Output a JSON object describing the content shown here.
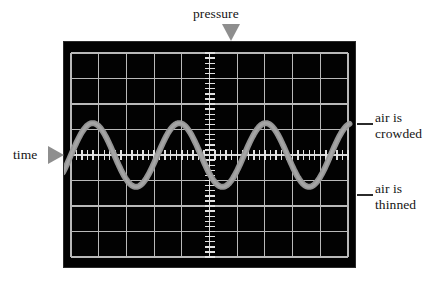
{
  "figure": {
    "background_color": "#ffffff"
  },
  "labels": {
    "pressure": "pressure",
    "time": "time",
    "crowded_line1": "air is",
    "crowded_line2": "crowded",
    "thinned_line1": "air is",
    "thinned_line2": "thinned",
    "crowded": "air is crowded",
    "thinned": "air is thinned"
  },
  "colors": {
    "screen_background": "#020202",
    "grid": "#b9b9b9",
    "axis": "#d8d8d8",
    "tick": "#e2e2e2",
    "trace": "#9a9a9a",
    "trace_core": "#ababab",
    "marker": "#8e8e8e",
    "text": "#151515",
    "leader": "#2b2b2b"
  },
  "scope": {
    "screen": {
      "x": 63,
      "y": 41,
      "width": 293,
      "height": 227
    },
    "grid": {
      "columns": 10,
      "rows": 8,
      "plot_x": 8,
      "plot_y": 12,
      "plot_width": 277,
      "plot_height": 204,
      "line_width": 1.1
    },
    "vertical_axis": {
      "name": "pressure-axis",
      "x_ratio": 0.5,
      "tick_count": 40,
      "tick_half_length": 5,
      "tick_width": 1.4
    },
    "horizontal_axis": {
      "name": "time-axis",
      "y_ratio": 0.5,
      "tick_count": 50,
      "tick_half_length": 5,
      "tick_width": 1.4
    }
  },
  "chart_data": {
    "type": "line",
    "xlabel": "time",
    "ylabel": "pressure",
    "grid": true,
    "legend": null,
    "annotations": [
      {
        "text": "pressure",
        "position": "top-center",
        "marker": "down-triangle"
      },
      {
        "text": "time",
        "position": "left-middle",
        "marker": "right-triangle"
      },
      {
        "text": "air is crowded",
        "position": "right",
        "points_to": "wave crest"
      },
      {
        "text": "air is thinned",
        "position": "right",
        "points_to": "wave trough"
      }
    ],
    "series": [
      {
        "name": "sound pressure",
        "waveform": "sine",
        "cycles": 3.2,
        "amplitude_divisions": 1.25,
        "phase_degrees": 0,
        "color": "#9a9a9a",
        "line_width": 6,
        "x": [
          0,
          0.05,
          0.1,
          0.15,
          0.2,
          0.25,
          0.3,
          0.35,
          0.4,
          0.45,
          0.5,
          0.55,
          0.6,
          0.65,
          0.7,
          0.75,
          0.8,
          0.85,
          0.9,
          0.95,
          1.0
        ],
        "y": [
          0,
          0.85,
          0.99,
          0.6,
          -0.06,
          -0.68,
          -1.0,
          -0.79,
          -0.19,
          0.5,
          0.95,
          0.92,
          0.41,
          -0.31,
          -0.88,
          -1.0,
          -0.58,
          0.13,
          0.74,
          1.0,
          0.71
        ]
      }
    ],
    "xlim": [
      0,
      1
    ],
    "ylim": [
      -1.25,
      1.25
    ],
    "ytick_labels": [],
    "xtick_labels": []
  }
}
